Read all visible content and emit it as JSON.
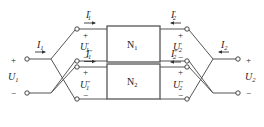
{
  "diagram": {
    "networks": [
      {
        "name": "N",
        "sub": "1"
      },
      {
        "name": "N",
        "sub": "2"
      }
    ],
    "port1": {
      "current": {
        "name": "I",
        "sub": "1"
      },
      "voltage": {
        "name": "U",
        "sub": "1"
      },
      "plus": "+",
      "minus": "−"
    },
    "port2": {
      "current": {
        "name": "I",
        "sub": "2"
      },
      "voltage": {
        "name": "U",
        "sub": "2"
      },
      "plus": "+",
      "minus": "−"
    },
    "n1_left": {
      "current": {
        "name": "I",
        "sub": "1",
        "prime": "′"
      },
      "voltage": {
        "name": "U",
        "sub": "1",
        "prime": "′"
      },
      "plus": "+",
      "minus": "−"
    },
    "n1_right": {
      "current": {
        "name": "I",
        "sub": "2",
        "prime": "′"
      },
      "voltage": {
        "name": "U",
        "sub": "2",
        "prime": "′"
      },
      "plus": "+",
      "minus": "−"
    },
    "n2_left": {
      "current": {
        "name": "I",
        "sub": "1",
        "prime": "″"
      },
      "voltage": {
        "name": "U",
        "sub": "1",
        "prime": "″"
      },
      "plus": "+",
      "minus": "−"
    },
    "n2_right": {
      "current": {
        "name": "I",
        "sub": "2",
        "prime": "″"
      },
      "voltage": {
        "name": "U",
        "sub": "2",
        "prime": "″"
      },
      "plus": "+",
      "minus": "−"
    }
  }
}
